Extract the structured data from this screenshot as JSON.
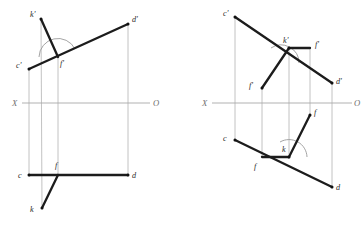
{
  "figure": {
    "caption": "",
    "canvas": {
      "width": 363,
      "height": 228,
      "background": "#ffffff"
    }
  },
  "colors": {
    "heavy_line": "#1c1c1c",
    "thin_line": "#b3b3b3",
    "axis_line": "#a8a8a8",
    "arc_line": "#9a9a9a",
    "label_text": "#2a2a2a",
    "axis_label_text": "#6d6d6d",
    "point_dot": "#111111"
  },
  "axis": {
    "left": {
      "label_x": "X",
      "label_o": "O",
      "y": 103,
      "x_start": 22,
      "x_end": 150
    },
    "right": {
      "label_x": "X",
      "label_o": "O",
      "y": 103,
      "x_start": 212,
      "x_end": 352
    }
  },
  "left_figure": {
    "name": "left-projection",
    "points": {
      "k_prime": {
        "label": "k'",
        "x": 41,
        "y": 19,
        "lx": 30,
        "ly": 17
      },
      "d_prime": {
        "label": "d'",
        "x": 128,
        "y": 24,
        "lx": 132,
        "ly": 21
      },
      "c_prime": {
        "label": "c'",
        "x": 29,
        "y": 69,
        "lx": 17,
        "ly": 66
      },
      "f_prime": {
        "label": "f'",
        "x": 58,
        "y": 57,
        "lx": 61,
        "ly": 63
      },
      "c": {
        "label": "c",
        "x": 29,
        "y": 175,
        "lx": 19,
        "ly": 177
      },
      "d": {
        "label": "d",
        "x": 128,
        "y": 175,
        "lx": 132,
        "ly": 177
      },
      "f": {
        "label": "f",
        "x": 58,
        "y": 175,
        "lx": 56,
        "ly": 167
      },
      "k": {
        "label": "k",
        "x": 42,
        "y": 208,
        "lx": 31,
        "ly": 210
      }
    },
    "heavy_segments": [
      {
        "name": "cd-prime-frontal",
        "x1": 29,
        "y1": 69,
        "x2": 128,
        "y2": 24
      },
      {
        "name": "kf-prime-frontal",
        "x1": 41,
        "y1": 19,
        "x2": 58,
        "y2": 57
      },
      {
        "name": "cd-horizontal",
        "x1": 29,
        "y1": 175,
        "x2": 128,
        "y2": 175
      },
      {
        "name": "kf-horizontal",
        "x1": 42,
        "y1": 208,
        "x2": 58,
        "y2": 175
      }
    ],
    "thin_connectors": [
      {
        "name": "c-vertical",
        "x1": 29,
        "y1": 69,
        "x2": 29,
        "y2": 175
      },
      {
        "name": "d-vertical",
        "x1": 128,
        "y1": 24,
        "x2": 128,
        "y2": 175
      },
      {
        "name": "f-vertical",
        "x1": 58,
        "y1": 57,
        "x2": 58,
        "y2": 175
      },
      {
        "name": "k-vertical",
        "x1": 41,
        "y1": 19,
        "x2": 42,
        "y2": 208
      }
    ],
    "angle_arc": {
      "name": "right-angle-arc",
      "cx": 58,
      "cy": 57,
      "r": 19,
      "start_deg": 180,
      "end_deg": 335
    }
  },
  "right_figure": {
    "name": "right-projection",
    "points": {
      "c_prime": {
        "label": "c'",
        "x": 235,
        "y": 17,
        "lx": 224,
        "ly": 15
      },
      "k_prime": {
        "label": "k'",
        "x": 289,
        "y": 48,
        "lx": 283,
        "ly": 41
      },
      "f_prime_top": {
        "label": "f'",
        "x": 310,
        "y": 48,
        "lx": 315,
        "ly": 45
      },
      "f_prime_low": {
        "label": "f'",
        "x": 262,
        "y": 88,
        "lx": 251,
        "ly": 86
      },
      "d_prime": {
        "label": "d'",
        "x": 332,
        "y": 83,
        "lx": 336,
        "ly": 82
      },
      "f_upper": {
        "label": "f",
        "x": 310,
        "y": 115,
        "lx": 314,
        "ly": 114
      },
      "c": {
        "label": "c",
        "x": 235,
        "y": 140,
        "lx": 224,
        "ly": 139
      },
      "k": {
        "label": "k",
        "x": 289,
        "y": 157,
        "lx": 283,
        "ly": 150
      },
      "f_lower": {
        "label": "f",
        "x": 262,
        "y": 157,
        "lx": 256,
        "ly": 166
      },
      "d": {
        "label": "d",
        "x": 332,
        "y": 187,
        "lx": 336,
        "ly": 188
      }
    },
    "heavy_segments": [
      {
        "name": "cd-prime-frontal",
        "x1": 235,
        "y1": 17,
        "x2": 332,
        "y2": 83
      },
      {
        "name": "kf-prime-top",
        "x1": 289,
        "y1": 48,
        "x2": 310,
        "y2": 48
      },
      {
        "name": "kf-prime-low",
        "x1": 289,
        "y1": 48,
        "x2": 262,
        "y2": 88
      },
      {
        "name": "cd-horizontal",
        "x1": 235,
        "y1": 140,
        "x2": 332,
        "y2": 187
      },
      {
        "name": "kf-upper",
        "x1": 289,
        "y1": 157,
        "x2": 310,
        "y2": 115
      },
      {
        "name": "kf-lower",
        "x1": 289,
        "y1": 157,
        "x2": 262,
        "y2": 157
      }
    ],
    "thin_connectors": [
      {
        "name": "c-vertical",
        "x1": 235,
        "y1": 17,
        "x2": 235,
        "y2": 140
      },
      {
        "name": "d-vertical",
        "x1": 332,
        "y1": 83,
        "x2": 332,
        "y2": 187
      },
      {
        "name": "k-vertical",
        "x1": 289,
        "y1": 48,
        "x2": 289,
        "y2": 157
      },
      {
        "name": "f-low-vertical",
        "x1": 262,
        "y1": 88,
        "x2": 262,
        "y2": 157
      },
      {
        "name": "f-top-vertical",
        "x1": 310,
        "y1": 48,
        "x2": 310,
        "y2": 115
      }
    ],
    "angle_arcs": [
      {
        "name": "right-angle-arc-top",
        "cx": 289,
        "cy": 48,
        "r": 18,
        "start_deg": 55,
        "end_deg": 180
      },
      {
        "name": "right-angle-arc-bottom",
        "cx": 289,
        "cy": 157,
        "r": 18,
        "start_deg": 0,
        "end_deg": 122
      }
    ]
  }
}
